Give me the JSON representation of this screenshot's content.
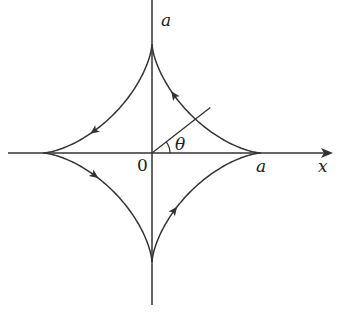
{
  "diagram": {
    "type": "astroid",
    "labels": {
      "top_a": "a",
      "right_a": "a",
      "x_axis": "x",
      "origin": "0",
      "angle": "θ"
    },
    "geometry": {
      "origin": [
        152,
        153
      ],
      "radius": 109,
      "parameter_angle_deg": 38
    },
    "arrows_direction": "counterclockwise",
    "colors": {
      "stroke": "#333333",
      "background": "#ffffff"
    }
  }
}
